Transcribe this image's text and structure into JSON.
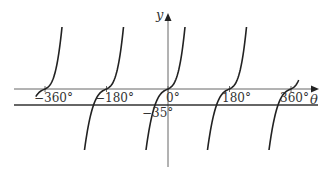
{
  "chart_data": {
    "type": "line",
    "title": "",
    "xlabel": "θ",
    "ylabel": "y",
    "x_ticks": [
      {
        "value": -360,
        "label": "−360°"
      },
      {
        "value": -180,
        "label": "−180°"
      },
      {
        "value": 0,
        "label": "0°"
      },
      {
        "value": 180,
        "label": "180°"
      },
      {
        "value": 360,
        "label": "360°"
      }
    ],
    "horizontal_line": {
      "value": -35,
      "label": "−35°"
    },
    "series": [
      {
        "name": "periodic curve (period 180°, inflection on θ-axis at each tick)",
        "inflection_points_x": [
          -360,
          -180,
          0,
          180,
          360
        ],
        "inflection_y": 0
      }
    ],
    "grid": false,
    "legend": null,
    "colors": {
      "curve": "#222222",
      "axis": "#555555",
      "line": "#333333"
    }
  }
}
